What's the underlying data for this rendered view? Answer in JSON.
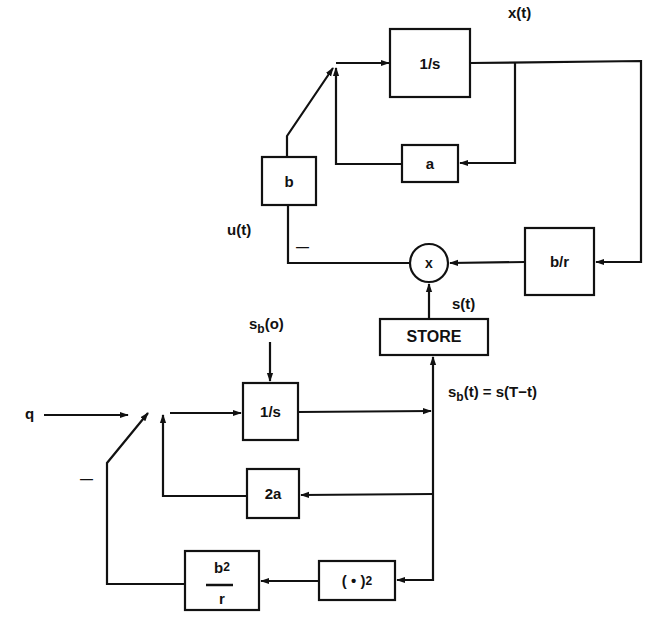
{
  "blocks": {
    "integrator_top": "1/s",
    "gain_a": "a",
    "gain_b": "b",
    "gain_b_over_r": "b/r",
    "multiplier": "x",
    "store": "STORE",
    "integrator_bottom": "1/s",
    "gain_2a": "2a",
    "square_base": "( • )",
    "square_exp": "2",
    "b2r_num_base": "b",
    "b2r_num_exp": "2",
    "b2r_den": "r"
  },
  "signals": {
    "x_t": "x(t)",
    "u_t": "u(t)",
    "s_t": "s(t)",
    "sb0_base": "s",
    "sb0_sub": "b",
    "sb0_rest": "(o)",
    "sbt_base": "s",
    "sbt_sub": "b",
    "sbt_rest": "(t) = s(T−t)",
    "q": "q",
    "minus_top": "—",
    "minus_bottom": "—"
  },
  "colors": {
    "line": "#111111",
    "background": "#ffffff"
  }
}
